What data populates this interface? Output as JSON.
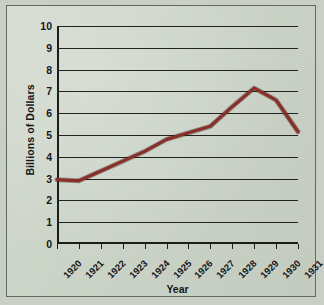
{
  "chart_data": {
    "type": "line",
    "title": "",
    "xlabel": "Year",
    "ylabel": "Billions of Dollars",
    "x": [
      1920,
      1921,
      1922,
      1923,
      1924,
      1925,
      1926,
      1927,
      1928,
      1929,
      1930,
      1931
    ],
    "categories": [
      "1920",
      "1921",
      "1922",
      "1923",
      "1924",
      "1925",
      "1926",
      "1927",
      "1928",
      "1929",
      "1930",
      "1931"
    ],
    "values": [
      2.95,
      2.9,
      3.35,
      3.8,
      4.25,
      4.8,
      5.1,
      5.4,
      6.3,
      7.15,
      6.6,
      5.15
    ],
    "series": [
      {
        "name": "Billions of Dollars",
        "values": [
          2.95,
          2.9,
          3.35,
          3.8,
          4.25,
          4.8,
          5.1,
          5.4,
          6.3,
          7.15,
          6.6,
          5.15
        ]
      }
    ],
    "ylim": [
      0,
      10
    ],
    "yticks": [
      "0",
      "1",
      "2",
      "3",
      "4",
      "5",
      "6",
      "7",
      "8",
      "9",
      "10"
    ],
    "grid": "horizontal",
    "legend": "none",
    "line_color": "#8a2f2a",
    "grid_color": "#20231f",
    "axis_color": "#1b1d1c",
    "plot_background": "#ccd4c8"
  }
}
